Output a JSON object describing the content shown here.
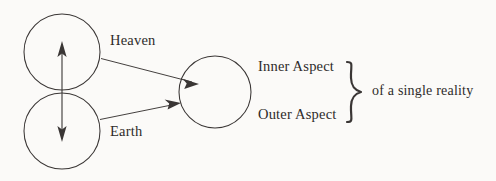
{
  "figure": {
    "background_color": "#fbfaf8",
    "ink_color": "#3a3635",
    "text_color": "#2e2b2a"
  },
  "labels": {
    "heaven": "Heaven",
    "earth": "Earth",
    "inner_aspect": "Inner Aspect",
    "outer_aspect": "Outer Aspect",
    "single_reality": "of a single reality"
  },
  "shapes": {
    "circles": [
      {
        "name": "heaven-circle",
        "cx": 62,
        "cy": 52,
        "r": 38
      },
      {
        "name": "earth-circle",
        "cx": 62,
        "cy": 131,
        "r": 38
      },
      {
        "name": "union-circle",
        "cx": 215,
        "cy": 92,
        "r": 36
      }
    ],
    "brace": {
      "name": "right-brace",
      "x": 346,
      "top": 62,
      "bottom": 122,
      "tip_x": 362
    }
  },
  "connectors": [
    {
      "name": "vertical-double-arrow",
      "from": [
        62,
        44
      ],
      "to": [
        62,
        139
      ],
      "arrowheads": "both"
    },
    {
      "name": "heaven-to-union-arrow",
      "from": [
        101,
        58
      ],
      "to": [
        196,
        83
      ],
      "arrowheads": "end"
    },
    {
      "name": "earth-to-union-arrow",
      "from": [
        100,
        119
      ],
      "to": [
        180,
        103
      ],
      "arrowheads": "end"
    }
  ]
}
